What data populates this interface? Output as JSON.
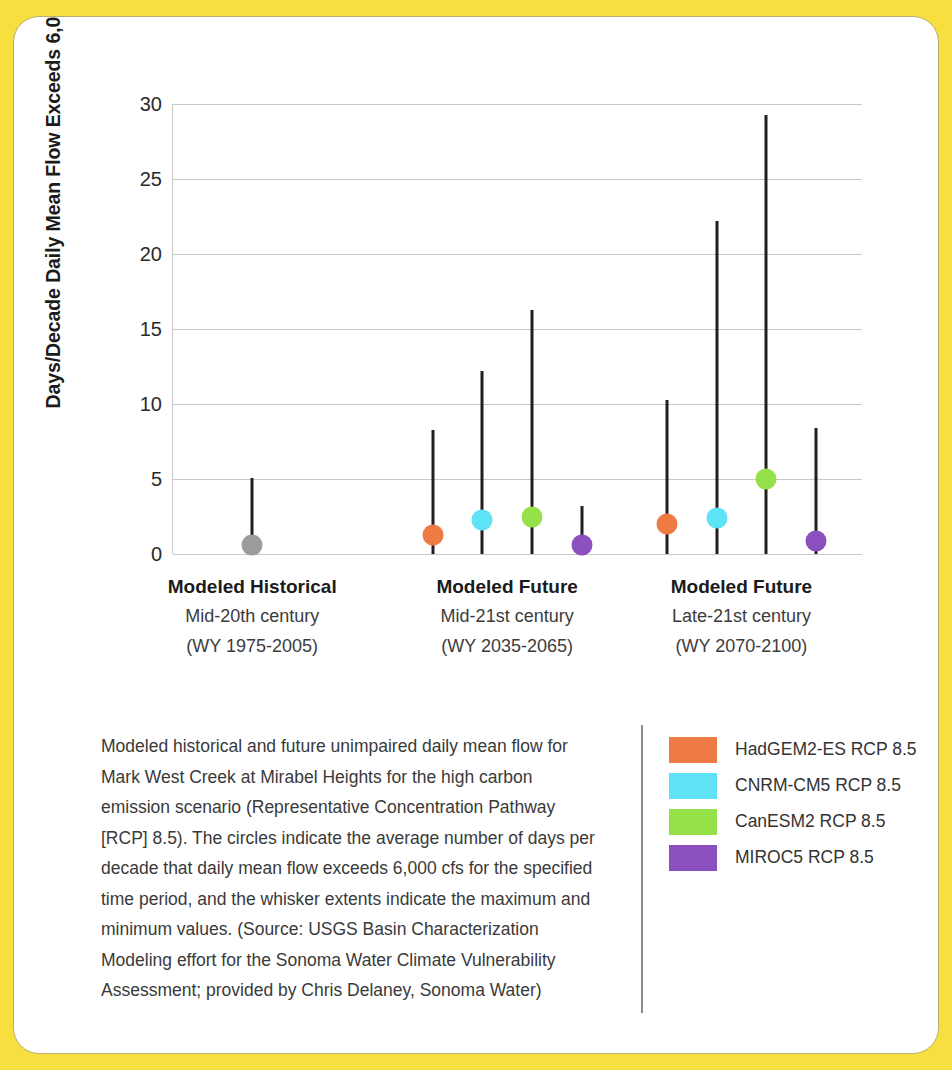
{
  "chart_data": {
    "type": "scatter",
    "title": "",
    "xlabel": "",
    "ylabel": "Days/Decade Daily Mean Flow Exceeds 6,000 cfs",
    "ylim": [
      0,
      30
    ],
    "yticks": [
      0,
      5,
      10,
      15,
      20,
      25,
      30
    ],
    "grid": true,
    "legend_position": "bottom-right",
    "legend": [
      {
        "name": "HadGEM2-ES RCP 8.5",
        "color": "#EE7B43"
      },
      {
        "name": "CNRM-CM5 RCP 8.5",
        "color": "#5EE2F5"
      },
      {
        "name": "CanESM2 RCP 8.5",
        "color": "#96E04A"
      },
      {
        "name": "MIROC5 RCP 8.5",
        "color": "#8B4FC0"
      }
    ],
    "groups": [
      {
        "title": "Modeled Historical",
        "line2": "Mid-20th century",
        "line3": "(WY 1975-2005)",
        "points": [
          {
            "model": "Modeled Historical",
            "color": "#9B9B9B",
            "value": 0.6,
            "min": 0,
            "max": 5.1
          }
        ]
      },
      {
        "title": "Modeled Future",
        "line2": "Mid-21st century",
        "line3": "(WY 2035-2065)",
        "points": [
          {
            "model": "HadGEM2-ES RCP 8.5",
            "color": "#EE7B43",
            "value": 1.3,
            "min": 0,
            "max": 8.3
          },
          {
            "model": "CNRM-CM5 RCP 8.5",
            "color": "#5EE2F5",
            "value": 2.3,
            "min": 0,
            "max": 12.2
          },
          {
            "model": "CanESM2 RCP 8.5",
            "color": "#96E04A",
            "value": 2.5,
            "min": 0,
            "max": 16.3
          },
          {
            "model": "MIROC5 RCP 8.5",
            "color": "#8B4FC0",
            "value": 0.6,
            "min": 0,
            "max": 3.2
          }
        ]
      },
      {
        "title": "Modeled Future",
        "line2": "Late-21st century",
        "line3": "(WY 2070-2100)",
        "points": [
          {
            "model": "HadGEM2-ES RCP 8.5",
            "color": "#EE7B43",
            "value": 2.0,
            "min": 0,
            "max": 10.3
          },
          {
            "model": "CNRM-CM5 RCP 8.5",
            "color": "#5EE2F5",
            "value": 2.4,
            "min": 0,
            "max": 22.2
          },
          {
            "model": "CanESM2 RCP 8.5",
            "color": "#96E04A",
            "value": 5.0,
            "min": 0,
            "max": 29.3
          },
          {
            "model": "MIROC5 RCP 8.5",
            "color": "#8B4FC0",
            "value": 0.9,
            "min": 0,
            "max": 8.4
          }
        ]
      }
    ]
  },
  "caption": {
    "text": "Modeled historical and future unimpaired daily mean flow for Mark West Creek at Mirabel Heights for the high carbon emission scenario (Representative Concentration Pathway [RCP] 8.5). The circles indicate the average number of days per decade that daily mean flow exceeds 6,000 cfs for the specified time period, and the whisker extents indicate the maximum and minimum values. (Source: USGS Basin Characterization Modeling effort for the Sonoma Water Climate Vulnerability Assessment; provided by Chris Delaney, Sonoma Water)"
  },
  "theme": {
    "page_background": "#F7DF3F",
    "card_background": "#FFFFFF",
    "grid_color": "#C9C9C9",
    "whisker_color": "#231F20"
  }
}
